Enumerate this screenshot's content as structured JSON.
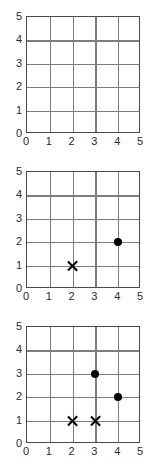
{
  "figure": {
    "title": "",
    "panel_count": 3,
    "colors": {
      "background": "#ffffff",
      "grid": "#7d7d7d",
      "border": "#4a4a4a",
      "marker": "#000000",
      "text": "#2b2b2b"
    }
  },
  "axis": {
    "x_ticks": [
      "0",
      "1",
      "2",
      "3",
      "4",
      "5"
    ],
    "y_ticks": [
      "5",
      "4",
      "3",
      "2",
      "1",
      "0"
    ],
    "xlabel": "",
    "ylabel": ""
  },
  "chart_data": [
    {
      "type": "scatter",
      "title": "",
      "xlabel": "",
      "ylabel": "",
      "xlim": [
        0,
        5
      ],
      "ylim": [
        0,
        5
      ],
      "xticks": [
        0,
        1,
        2,
        3,
        4,
        5
      ],
      "yticks": [
        0,
        1,
        2,
        3,
        4,
        5
      ],
      "grid": true,
      "legend": "none",
      "series": [
        {
          "name": "cross",
          "marker": "x",
          "points": []
        },
        {
          "name": "dot",
          "marker": "filled-circle",
          "points": []
        }
      ]
    },
    {
      "type": "scatter",
      "title": "",
      "xlabel": "",
      "ylabel": "",
      "xlim": [
        0,
        5
      ],
      "ylim": [
        0,
        5
      ],
      "xticks": [
        0,
        1,
        2,
        3,
        4,
        5
      ],
      "yticks": [
        0,
        1,
        2,
        3,
        4,
        5
      ],
      "grid": true,
      "legend": "none",
      "series": [
        {
          "name": "cross",
          "marker": "x",
          "points": [
            [
              2,
              1
            ]
          ]
        },
        {
          "name": "dot",
          "marker": "filled-circle",
          "points": [
            [
              4,
              2
            ]
          ]
        }
      ]
    },
    {
      "type": "scatter",
      "title": "",
      "xlabel": "",
      "ylabel": "",
      "xlim": [
        0,
        5
      ],
      "ylim": [
        0,
        5
      ],
      "xticks": [
        0,
        1,
        2,
        3,
        4,
        5
      ],
      "yticks": [
        0,
        1,
        2,
        3,
        4,
        5
      ],
      "grid": true,
      "legend": "none",
      "series": [
        {
          "name": "cross",
          "marker": "x",
          "points": [
            [
              2,
              1
            ],
            [
              3,
              1
            ]
          ]
        },
        {
          "name": "dot",
          "marker": "filled-circle",
          "points": [
            [
              3,
              3
            ],
            [
              4,
              2
            ]
          ]
        }
      ]
    }
  ]
}
